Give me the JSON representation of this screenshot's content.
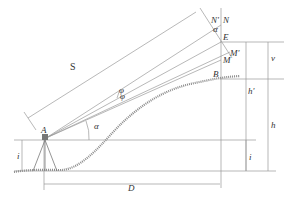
{
  "figure": {
    "type": "trigonometric-leveling-diagram",
    "labels": {
      "S": "S",
      "N_prime": "N'",
      "N": "N",
      "alpha_top": "α",
      "E": "E",
      "M_prime": "M'",
      "M": "M",
      "B": "B",
      "v": "v",
      "h_prime": "h'",
      "h": "h",
      "i_right": "i",
      "i_left": "i",
      "A": "A",
      "alpha_station": "α",
      "D": "D",
      "phi1": "φ",
      "phi2": "φ"
    }
  }
}
